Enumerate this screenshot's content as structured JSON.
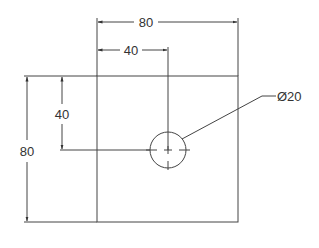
{
  "drawing": {
    "colors": {
      "line": "#444444",
      "background": "#ffffff"
    },
    "part": {
      "shape": "square",
      "size": 80
    },
    "hole": {
      "label": "Ø20",
      "diameter": 20
    },
    "dimensions": {
      "overall_width": "80",
      "hole_x_offset": "40",
      "overall_height": "80",
      "hole_y_offset": "40",
      "hole_diameter": "Ø20"
    }
  }
}
